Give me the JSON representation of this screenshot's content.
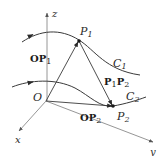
{
  "diagram": {
    "axes": {
      "x_label": "x",
      "y_label": "y",
      "z_label": "z",
      "origin_label": "O"
    },
    "points": [
      {
        "id": "P1",
        "label": "P",
        "subscript": "1"
      },
      {
        "id": "P2",
        "label": "P",
        "subscript": "2"
      }
    ],
    "curves": [
      {
        "id": "C1",
        "label": "C",
        "subscript": "1"
      },
      {
        "id": "C2",
        "label": "C",
        "subscript": "2"
      }
    ],
    "vectors": [
      {
        "id": "OP1",
        "label": "OP",
        "subscript": "1"
      },
      {
        "id": "OP2",
        "label": "OP",
        "subscript": "2"
      },
      {
        "id": "P1P2",
        "label_a": "P",
        "sub_a": "1",
        "label_b": "P",
        "sub_b": "2"
      }
    ],
    "colors": {
      "axis": "#8a8a8a",
      "curve": "#3a3a3a",
      "text": "#2a2a2a"
    }
  }
}
